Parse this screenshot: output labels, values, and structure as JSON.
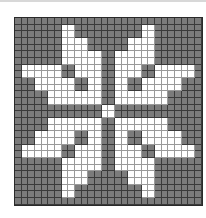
{
  "pattern": {
    "title": "",
    "cols": 28,
    "rows_count": 28,
    "colors": {
      "filled": "#ffffff",
      "background": "#7b7b7b",
      "grid_line": "#333333"
    },
    "legend": {
      "W": "white",
      ".": "gray"
    },
    "rows": [
      "............................",
      ".......WW..........WW.......",
      ".......WW..........WW.......",
      ".......WWWW......WWWW.......",
      ".......WWWW......WWWW.......",
      ".......WWWWWW..WWWWWW.......",
      ".......WWWWWW..WWWWWW.......",
      ".WWWWWW..WWWW..WWWW..WWWWWW.",
      ".WWWWWW..WWWW..WWWW..WWWWWW.",
      "...WWWWWW..WW..WW..WWWWWW...",
      "...WWWWWW..WW..WW..WWWWWW...",
      ".....WWWWWWWW..WWWWWWWW.....",
      ".....WWWWWWWW..WWWWWWWW.....",
      ".............WW.............",
      ".............WW.............",
      ".....WWWWWWWW..WWWWWWWW.....",
      ".....WWWWWWWW..WWWWWWWW.....",
      "...WWWWWW..WW..WW..WWWWWW...",
      "...WWWWWW..WW..WW..WWWWWW...",
      ".WWWWWW..WWWW..WWWW..WWWWWW.",
      ".WWWWWW..WWWW..WWWW..WWWWWW.",
      ".......WWWWWW..WWWWWW.......",
      ".......WWWWWW..WWWWWW.......",
      ".......WWWW......WWWW.......",
      ".......WWWW......WWWW.......",
      ".......WW..........WW.......",
      ".......WW..........WW.......",
      "............................"
    ]
  }
}
